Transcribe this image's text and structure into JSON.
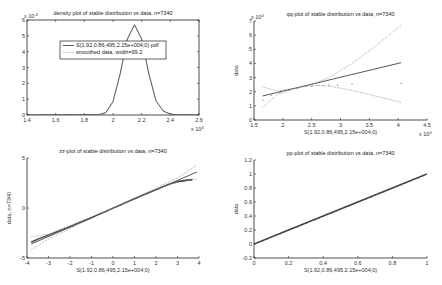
{
  "chart_data": [
    {
      "id": "density",
      "type": "line",
      "title": "density plot of stable distribution vs data, n=7340",
      "xlabel": "",
      "ylabel": "",
      "x_exponent": "x 10^4",
      "y_exponent": "x 10^-4",
      "xlim": [
        1.4,
        2.6
      ],
      "ylim": [
        0,
        6
      ],
      "xticks": [
        "1.4",
        "1.6",
        "1.8",
        "2",
        "2.2",
        "2.4",
        "2.6"
      ],
      "yticks": [
        "0",
        "1",
        "2",
        "3",
        "4",
        "5",
        "6"
      ],
      "box": true,
      "legend": {
        "position": "inside-top",
        "entries": [
          "S(1.92,0.86,495,2.15e+004;0) pdf",
          "smoothed data, width=99.2"
        ]
      },
      "series": [
        {
          "name": "S(1.92,0.86,495,2.15e+004;0) pdf",
          "style": "solid",
          "x": [
            1.4,
            1.9,
            1.95,
            2.0,
            2.05,
            2.1,
            2.15,
            2.2,
            2.25,
            2.3,
            2.35,
            2.4,
            2.45,
            2.6
          ],
          "y": [
            0,
            0.02,
            0.15,
            0.85,
            2.6,
            4.8,
            5.7,
            4.8,
            2.6,
            0.9,
            0.25,
            0.06,
            0.01,
            0
          ]
        },
        {
          "name": "smoothed data, width=99.2",
          "style": "dotted",
          "x": [
            1.4,
            1.9,
            1.95,
            2.0,
            2.05,
            2.1,
            2.15,
            2.2,
            2.25,
            2.3,
            2.35,
            2.4,
            2.45,
            2.6
          ],
          "y": [
            0,
            0.02,
            0.15,
            0.85,
            2.6,
            4.8,
            5.7,
            4.8,
            2.6,
            0.9,
            0.25,
            0.06,
            0.01,
            0
          ]
        }
      ]
    },
    {
      "id": "qq",
      "type": "scatter",
      "title": "qq-plot of stable distribution vs data, n=7340",
      "xlabel": "S(1.92,0.86,495,2.15e+004;0)",
      "ylabel": "data",
      "x_exponent": "x 10^4",
      "y_exponent": "x 10^4",
      "xlim": [
        1.5,
        4.5
      ],
      "ylim": [
        0,
        7
      ],
      "xticks": [
        "1.5",
        "2",
        "2.5",
        "3",
        "3.5",
        "4",
        "4.5"
      ],
      "yticks": [
        "0",
        "1",
        "2",
        "3",
        "4",
        "5",
        "6",
        "7"
      ],
      "box": false,
      "series": [
        {
          "name": "data points",
          "style": "markers",
          "x": [
            1.65,
            1.8,
            1.95,
            2.1,
            2.25,
            2.4,
            2.5,
            2.6,
            2.7,
            2.8,
            2.95,
            3.2,
            4.05
          ],
          "y": [
            1.45,
            1.8,
            2.0,
            2.15,
            2.3,
            2.4,
            2.45,
            2.5,
            2.5,
            2.5,
            2.52,
            2.55,
            2.6
          ]
        },
        {
          "name": "reference line",
          "style": "solid",
          "x": [
            1.65,
            4.05
          ],
          "y": [
            1.7,
            4.05
          ]
        },
        {
          "name": "upper envelope",
          "style": "dotted",
          "x": [
            1.65,
            1.9,
            2.2,
            2.5,
            2.8,
            3.2,
            3.6,
            4.05
          ],
          "y": [
            0.9,
            1.8,
            2.2,
            2.5,
            3.0,
            4.0,
            5.2,
            6.7
          ]
        },
        {
          "name": "lower envelope",
          "style": "dotted",
          "x": [
            1.65,
            1.9,
            2.2,
            2.5,
            2.8,
            3.2,
            3.6,
            4.05
          ],
          "y": [
            2.35,
            2.05,
            2.25,
            2.45,
            2.4,
            2.1,
            1.7,
            1.25
          ]
        }
      ]
    },
    {
      "id": "zz",
      "type": "scatter",
      "title": "zz-plot of stable distribution vs data, n=7340",
      "xlabel": "S(1.92,0.86,495,2.15e+004;0)",
      "ylabel": "data, n=7340",
      "xlim": [
        -4,
        4
      ],
      "ylim": [
        -5,
        5
      ],
      "xticks": [
        "-4",
        "-3",
        "-2",
        "-1",
        "0",
        "1",
        "2",
        "3",
        "4"
      ],
      "yticks": [
        "-5",
        "0",
        "5"
      ],
      "box": false,
      "series": [
        {
          "name": "data points",
          "style": "markers",
          "x": [
            -3.8,
            -3.5,
            -3.0,
            -2.0,
            -1.0,
            0.0,
            1.0,
            2.0,
            2.5,
            3.0,
            3.3,
            3.7
          ],
          "y": [
            -3.4,
            -3.1,
            -2.7,
            -1.85,
            -0.95,
            0.0,
            0.95,
            1.85,
            2.3,
            2.65,
            2.75,
            2.85
          ]
        },
        {
          "name": "reference line",
          "style": "solid",
          "x": [
            -3.8,
            3.9
          ],
          "y": [
            -3.6,
            3.6
          ]
        },
        {
          "name": "upper envelope",
          "style": "dotted",
          "x": [
            -3.8,
            -3.0,
            0.0,
            3.0,
            3.9
          ],
          "y": [
            -2.9,
            -2.6,
            0.0,
            3.0,
            4.3
          ]
        },
        {
          "name": "lower envelope",
          "style": "dotted",
          "x": [
            -3.8,
            -3.0,
            0.0,
            3.0,
            3.9
          ],
          "y": [
            -4.2,
            -3.1,
            0.0,
            2.7,
            2.9
          ]
        }
      ]
    },
    {
      "id": "pp",
      "type": "scatter",
      "title": "pp-plot of stable distribution vs data, n=7340",
      "xlabel": "S(1.92,0.86,495,2.15e+004;0)",
      "ylabel": "data",
      "xlim": [
        0,
        1
      ],
      "ylim": [
        -0.2,
        1.2
      ],
      "xticks": [
        "0",
        "0.2",
        "0.4",
        "0.6",
        "0.8",
        "1"
      ],
      "yticks": [
        "-0.2",
        "0",
        "0.2",
        "0.4",
        "0.6",
        "0.8",
        "1",
        "1.2"
      ],
      "box": false,
      "series": [
        {
          "name": "data points",
          "style": "markers",
          "x": [
            0,
            0.2,
            0.4,
            0.6,
            0.8,
            1.0
          ],
          "y": [
            0,
            0.2,
            0.4,
            0.6,
            0.8,
            1.0
          ]
        }
      ]
    }
  ]
}
